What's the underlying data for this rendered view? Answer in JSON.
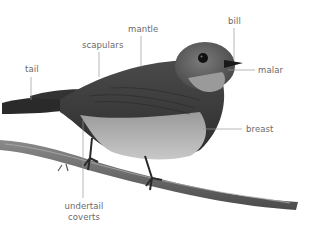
{
  "diagram": {
    "labels": [
      {
        "id": "tail",
        "text": "tail"
      },
      {
        "id": "scapulars",
        "text": "scapulars"
      },
      {
        "id": "mantle",
        "text": "mantle"
      },
      {
        "id": "bill",
        "text": "bill"
      },
      {
        "id": "malar",
        "text": "malar"
      },
      {
        "id": "breast",
        "text": "breast"
      },
      {
        "id": "undertail_coverts",
        "line1": "undertail",
        "line2": "coverts"
      }
    ],
    "colors": {
      "label_text": "#6a6a6a",
      "leader_line": "#9a9a9a",
      "background": "#ffffff"
    }
  }
}
